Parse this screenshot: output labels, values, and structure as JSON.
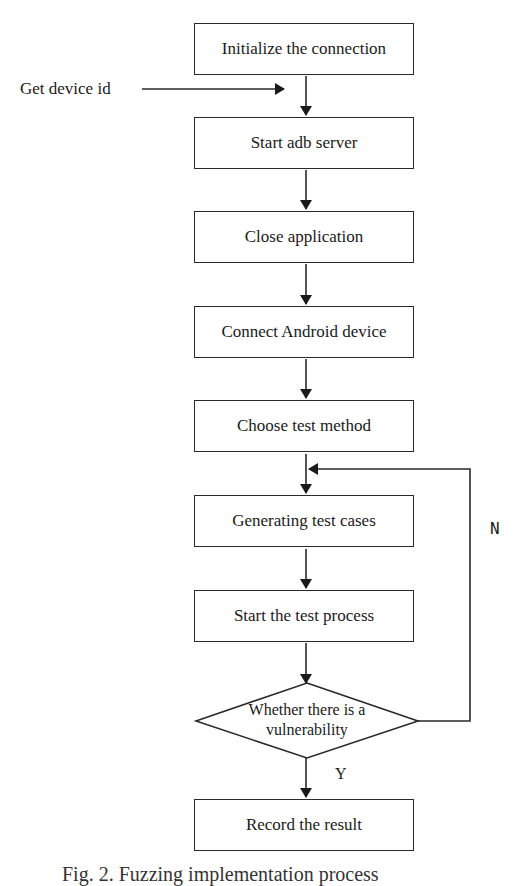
{
  "diagram": {
    "type": "flowchart",
    "steps": [
      {
        "id": "s1",
        "label": "Initialize the connection"
      },
      {
        "id": "s2",
        "label": "Start adb server"
      },
      {
        "id": "s3",
        "label": "Close application"
      },
      {
        "id": "s4",
        "label": "Connect Android device"
      },
      {
        "id": "s5",
        "label": "Choose test method"
      },
      {
        "id": "s6",
        "label": "Generating test cases"
      },
      {
        "id": "s7",
        "label": "Start the test process"
      },
      {
        "id": "s9",
        "label": "Record the result"
      }
    ],
    "decision": {
      "id": "d1",
      "line1": "Whether there is a",
      "line2": "vulnerability",
      "yes_label": "Y",
      "no_label": "N"
    },
    "side_input": {
      "label": "Get device id"
    },
    "caption": "Fig. 2. Fuzzing implementation process",
    "edges": [
      {
        "from": "s1",
        "to": "s2"
      },
      {
        "from": "side_input",
        "to": "s1-s2 edge"
      },
      {
        "from": "s2",
        "to": "s3"
      },
      {
        "from": "s3",
        "to": "s4"
      },
      {
        "from": "s4",
        "to": "s5"
      },
      {
        "from": "s5",
        "to": "s6"
      },
      {
        "from": "s6",
        "to": "s7"
      },
      {
        "from": "s7",
        "to": "d1"
      },
      {
        "from": "d1",
        "to": "s9",
        "label": "Y"
      },
      {
        "from": "d1",
        "to": "s6",
        "label": "N"
      }
    ]
  }
}
